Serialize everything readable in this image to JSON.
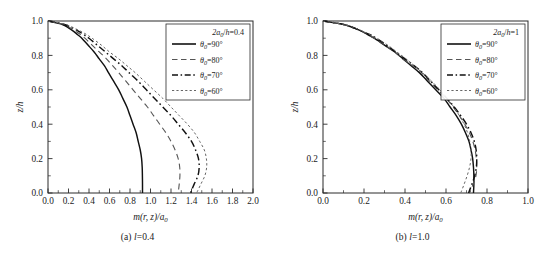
{
  "figure": {
    "panels": [
      {
        "id": "panel-a",
        "caption_prefix": "(a) ",
        "caption_symbol": "l",
        "caption_value": "=0.4",
        "legend_title": "2a₀/h=0.4",
        "xlabel_main": "m(r, z)/a",
        "xlabel_sub": "0",
        "ylabel": "z/h",
        "xticks": [
          "0.0",
          "0.2",
          "0.4",
          "0.6",
          "0.8",
          "1.0",
          "1.2",
          "1.4",
          "1.6",
          "1.8",
          "2.0"
        ],
        "yticks": [
          "0.0",
          "0.2",
          "0.4",
          "0.6",
          "0.8",
          "1.0"
        ],
        "legend": [
          {
            "label_pre": "θ",
            "label_sub": "0",
            "label_post": "=90°",
            "style": "solid"
          },
          {
            "label_pre": "θ",
            "label_sub": "0",
            "label_post": "=80°",
            "style": "dashed"
          },
          {
            "label_pre": "θ",
            "label_sub": "0",
            "label_post": "=70°",
            "style": "dashdot"
          },
          {
            "label_pre": "θ",
            "label_sub": "0",
            "label_post": "=60°",
            "style": "dotted"
          }
        ]
      },
      {
        "id": "panel-b",
        "caption_prefix": "(b) ",
        "caption_symbol": "l",
        "caption_value": "=1.0",
        "legend_title": "2a₀/h=1",
        "xlabel_main": "m(r, z)/a",
        "xlabel_sub": "0",
        "ylabel": "z/h",
        "xticks": [
          "0.0",
          "0.2",
          "0.4",
          "0.6",
          "0.8",
          "1.0"
        ],
        "yticks": [
          "0.0",
          "0.2",
          "0.4",
          "0.6",
          "0.8",
          "1.0"
        ],
        "legend": [
          {
            "label_pre": "θ",
            "label_sub": "0",
            "label_post": "=90°",
            "style": "solid"
          },
          {
            "label_pre": "θ",
            "label_sub": "0",
            "label_post": "=80°",
            "style": "dashed"
          },
          {
            "label_pre": "θ",
            "label_sub": "0",
            "label_post": "=70°",
            "style": "dashdot"
          },
          {
            "label_pre": "θ",
            "label_sub": "0",
            "label_post": "=60°",
            "style": "dotted"
          }
        ]
      }
    ]
  },
  "chart_data": [
    {
      "type": "line",
      "title": "(a) l=0.4",
      "subtitle": "2a0/h=0.4",
      "xlabel": "m(r, z)/a0",
      "ylabel": "z/h",
      "xlim": [
        0.0,
        2.0
      ],
      "ylim": [
        0.0,
        1.0
      ],
      "xticks": [
        0.0,
        0.2,
        0.4,
        0.6,
        0.8,
        1.0,
        1.2,
        1.4,
        1.6,
        1.8,
        2.0
      ],
      "yticks": [
        0.0,
        0.2,
        0.4,
        0.6,
        0.8,
        1.0
      ],
      "grid": false,
      "legend_position": "top-right",
      "series": [
        {
          "name": "theta0=90",
          "style": "solid",
          "y": [
            1.0,
            0.98,
            0.96,
            0.94,
            0.92,
            0.9,
            0.86,
            0.82,
            0.78,
            0.74,
            0.7,
            0.65,
            0.6,
            0.55,
            0.5,
            0.45,
            0.4,
            0.35,
            0.3,
            0.25,
            0.2,
            0.15,
            0.1,
            0.05,
            0.0
          ],
          "x": [
            0.0,
            0.14,
            0.2,
            0.25,
            0.29,
            0.33,
            0.39,
            0.45,
            0.5,
            0.55,
            0.59,
            0.64,
            0.69,
            0.73,
            0.77,
            0.8,
            0.83,
            0.86,
            0.88,
            0.9,
            0.913,
            0.919,
            0.921,
            0.922,
            0.922
          ]
        },
        {
          "name": "theta0=80",
          "style": "dashed",
          "y": [
            1.0,
            0.98,
            0.96,
            0.94,
            0.92,
            0.9,
            0.86,
            0.82,
            0.78,
            0.74,
            0.7,
            0.65,
            0.6,
            0.55,
            0.5,
            0.45,
            0.4,
            0.35,
            0.3,
            0.25,
            0.2,
            0.15,
            0.1,
            0.05,
            0.0
          ],
          "x": [
            0.0,
            0.15,
            0.22,
            0.27,
            0.32,
            0.36,
            0.43,
            0.5,
            0.57,
            0.63,
            0.69,
            0.76,
            0.83,
            0.9,
            0.97,
            1.03,
            1.09,
            1.15,
            1.2,
            1.24,
            1.27,
            1.285,
            1.287,
            1.28,
            1.27
          ]
        },
        {
          "name": "theta0=70",
          "style": "dashdot",
          "y": [
            1.0,
            0.98,
            0.96,
            0.94,
            0.92,
            0.9,
            0.86,
            0.82,
            0.78,
            0.74,
            0.7,
            0.65,
            0.6,
            0.55,
            0.5,
            0.45,
            0.4,
            0.35,
            0.3,
            0.25,
            0.2,
            0.15,
            0.1,
            0.05,
            0.0
          ],
          "x": [
            0.0,
            0.16,
            0.24,
            0.3,
            0.35,
            0.4,
            0.48,
            0.56,
            0.64,
            0.72,
            0.79,
            0.88,
            0.96,
            1.04,
            1.12,
            1.2,
            1.27,
            1.34,
            1.4,
            1.44,
            1.468,
            1.475,
            1.462,
            1.425,
            1.39
          ]
        },
        {
          "name": "theta0=60",
          "style": "dotted",
          "y": [
            1.0,
            0.98,
            0.96,
            0.94,
            0.92,
            0.9,
            0.86,
            0.82,
            0.78,
            0.74,
            0.7,
            0.65,
            0.6,
            0.55,
            0.5,
            0.45,
            0.4,
            0.35,
            0.3,
            0.25,
            0.2,
            0.15,
            0.1,
            0.05,
            0.0
          ],
          "x": [
            0.0,
            0.17,
            0.25,
            0.32,
            0.38,
            0.43,
            0.52,
            0.6,
            0.69,
            0.77,
            0.85,
            0.94,
            1.03,
            1.12,
            1.2,
            1.28,
            1.36,
            1.43,
            1.48,
            1.525,
            1.545,
            1.548,
            1.53,
            1.49,
            1.45
          ]
        }
      ]
    },
    {
      "type": "line",
      "title": "(b) l=1.0",
      "subtitle": "2a0/h=1",
      "xlabel": "m(r, z)/a0",
      "ylabel": "z/h",
      "xlim": [
        0.0,
        1.0
      ],
      "ylim": [
        0.0,
        1.0
      ],
      "xticks": [
        0.0,
        0.2,
        0.4,
        0.6,
        0.8,
        1.0
      ],
      "yticks": [
        0.0,
        0.2,
        0.4,
        0.6,
        0.8,
        1.0
      ],
      "grid": false,
      "legend_position": "top-right",
      "series": [
        {
          "name": "theta0=90",
          "style": "solid",
          "y": [
            1.0,
            0.98,
            0.96,
            0.94,
            0.92,
            0.9,
            0.86,
            0.82,
            0.78,
            0.74,
            0.7,
            0.65,
            0.6,
            0.55,
            0.5,
            0.45,
            0.4,
            0.35,
            0.3,
            0.25,
            0.2,
            0.15,
            0.1,
            0.05,
            0.0
          ],
          "x": [
            0.0,
            0.1,
            0.15,
            0.19,
            0.22,
            0.25,
            0.3,
            0.35,
            0.39,
            0.43,
            0.47,
            0.51,
            0.55,
            0.59,
            0.62,
            0.65,
            0.675,
            0.695,
            0.712,
            0.722,
            0.73,
            0.734,
            0.736,
            0.736,
            0.734
          ]
        },
        {
          "name": "theta0=80",
          "style": "dashed",
          "y": [
            1.0,
            0.98,
            0.96,
            0.94,
            0.92,
            0.9,
            0.86,
            0.82,
            0.78,
            0.74,
            0.7,
            0.65,
            0.6,
            0.55,
            0.5,
            0.45,
            0.4,
            0.35,
            0.3,
            0.25,
            0.2,
            0.15,
            0.1,
            0.05,
            0.0
          ],
          "x": [
            0.0,
            0.1,
            0.15,
            0.19,
            0.22,
            0.25,
            0.3,
            0.35,
            0.39,
            0.44,
            0.48,
            0.52,
            0.56,
            0.6,
            0.635,
            0.665,
            0.692,
            0.714,
            0.731,
            0.742,
            0.748,
            0.75,
            0.746,
            0.732,
            0.715
          ]
        },
        {
          "name": "theta0=70",
          "style": "dashdot",
          "y": [
            1.0,
            0.98,
            0.96,
            0.94,
            0.92,
            0.9,
            0.86,
            0.82,
            0.78,
            0.74,
            0.7,
            0.65,
            0.6,
            0.55,
            0.5,
            0.45,
            0.4,
            0.35,
            0.3,
            0.25,
            0.2,
            0.15,
            0.1,
            0.05,
            0.0
          ],
          "x": [
            0.0,
            0.1,
            0.15,
            0.19,
            0.23,
            0.26,
            0.31,
            0.355,
            0.4,
            0.445,
            0.485,
            0.525,
            0.565,
            0.605,
            0.64,
            0.672,
            0.7,
            0.722,
            0.738,
            0.747,
            0.75,
            0.748,
            0.74,
            0.726,
            0.71
          ]
        },
        {
          "name": "theta0=60",
          "style": "dotted",
          "y": [
            1.0,
            0.98,
            0.96,
            0.94,
            0.92,
            0.9,
            0.86,
            0.82,
            0.78,
            0.74,
            0.7,
            0.65,
            0.6,
            0.55,
            0.5,
            0.45,
            0.4,
            0.35,
            0.3,
            0.25,
            0.2,
            0.15,
            0.1,
            0.05,
            0.0
          ],
          "x": [
            0.0,
            0.1,
            0.155,
            0.195,
            0.23,
            0.26,
            0.315,
            0.36,
            0.405,
            0.445,
            0.485,
            0.53,
            0.57,
            0.605,
            0.638,
            0.665,
            0.688,
            0.705,
            0.716,
            0.722,
            0.722,
            0.715,
            0.703,
            0.688,
            0.672
          ]
        }
      ]
    }
  ]
}
